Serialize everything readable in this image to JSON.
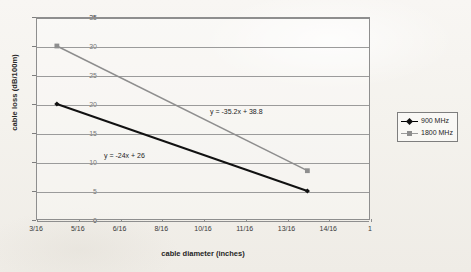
{
  "chart_data": {
    "type": "line",
    "title": "",
    "xlabel": "cable diameter (inches)",
    "ylabel": "cable loss (dB/100m)",
    "xtick_labels": [
      "3/16",
      "5/16",
      "6/16",
      "8/16",
      "10/16",
      "11/16",
      "13/16",
      "14/16",
      "1"
    ],
    "ytick_labels": [
      "0",
      "5",
      "10",
      "15",
      "20",
      "25",
      "30",
      "35"
    ],
    "ylim": [
      0,
      35
    ],
    "grid": true,
    "legend_position": "right",
    "series": [
      {
        "name": "900 MHz",
        "color": "#111111",
        "marker": "diamond",
        "points": [
          {
            "x": "4/16",
            "y": 20
          },
          {
            "x": "13.5/16",
            "y": 5
          }
        ]
      },
      {
        "name": "1800 MHz",
        "color": "#8e8e8e",
        "marker": "square",
        "points": [
          {
            "x": "4/16",
            "y": 30
          },
          {
            "x": "13.5/16",
            "y": 8.5
          }
        ]
      }
    ],
    "annotations": [
      {
        "id": "eq-1800",
        "text": "y = -35.2x + 38.8",
        "series": "1800 MHz"
      },
      {
        "id": "eq-900",
        "text": "y = -24x + 26",
        "series": "900 MHz"
      }
    ]
  },
  "legend": {
    "items": [
      {
        "label": "900 MHz"
      },
      {
        "label": "1800 MHz"
      }
    ]
  },
  "axes": {
    "y_title": "cable loss (dB/100m)",
    "x_title": "cable diameter (inches)"
  }
}
